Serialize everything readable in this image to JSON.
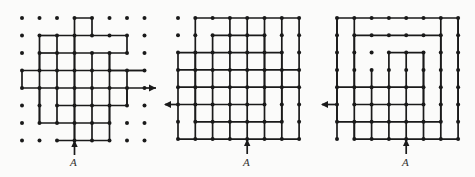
{
  "document": {
    "title": "Three lattice spiral path diagrams",
    "background_color": "#fbfbfa",
    "ink_color": "#1a1a1a",
    "width": 475,
    "height": 177
  },
  "figures": [
    {
      "id": "figure-1",
      "name": "stepped-diamond-spiral",
      "label": "A",
      "label_text": "A",
      "exit_arrow": {
        "direction": "right",
        "name": "exit-arrow-right"
      },
      "entry_arrow": {
        "direction": "up",
        "name": "entry-arrow-up"
      },
      "grid": {
        "columns": 7,
        "rows": 7,
        "spacing": 17.5,
        "dot_radius": 1.9
      },
      "description": "Dot lattice with a stepped diamond-shaped spiral path entering from below at A and exiting to the right."
    },
    {
      "id": "figure-2",
      "name": "rectangular-spiral-dense",
      "label": "A",
      "label_text": "A",
      "exit_arrow": {
        "direction": "left",
        "name": "exit-arrow-left"
      },
      "entry_arrow": {
        "direction": "up",
        "name": "entry-arrow-up"
      },
      "grid": {
        "columns": 8,
        "rows": 8,
        "spacing": 17.5,
        "dot_radius": 1.9
      },
      "description": "Dot lattice with a dense rectangular spiral path entering from below at A and exiting to the left."
    },
    {
      "id": "figure-3",
      "name": "rectangular-spiral-open",
      "label": "A",
      "label_text": "A",
      "exit_arrow": {
        "direction": "left",
        "name": "exit-arrow-left"
      },
      "entry_arrow": {
        "direction": "up",
        "name": "entry-arrow-up"
      },
      "grid": {
        "columns": 8,
        "rows": 8,
        "spacing": 17.5,
        "dot_radius": 1.9
      },
      "description": "Dot lattice with a three-turn open rectangular spiral path entering from below at A and exiting to the left."
    }
  ]
}
